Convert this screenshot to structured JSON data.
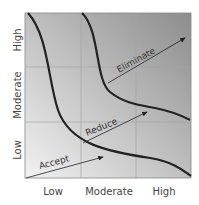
{
  "diagram": {
    "type": "risk-matrix",
    "x_axis": {
      "ticks": [
        "Low",
        "Moderate",
        "High"
      ]
    },
    "y_axis": {
      "ticks": [
        "Low",
        "Moderate",
        "High"
      ]
    },
    "annotations": [
      {
        "label": "Accept"
      },
      {
        "label": "Reduce"
      },
      {
        "label": "Eliminate"
      }
    ],
    "colors": {
      "background_dark": "#8f8f8f",
      "background_light": "#ececec",
      "curve": "#222222",
      "grid": "#9a9a9a"
    }
  }
}
